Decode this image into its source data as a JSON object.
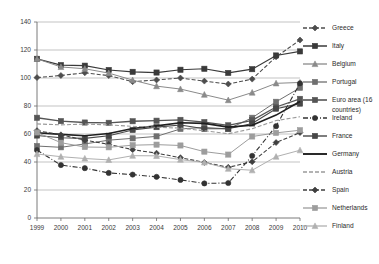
{
  "chart_data": {
    "type": "line",
    "title": "",
    "xlabel": "",
    "ylabel": "",
    "x": [
      1999,
      2000,
      2001,
      2002,
      2003,
      2004,
      2005,
      2006,
      2007,
      2008,
      2009,
      2010
    ],
    "xtick_labels": [
      "1999",
      "2000",
      "2001",
      "2002",
      "2003",
      "2004",
      "2005",
      "2006",
      "2007",
      "2008",
      "2009",
      "2010"
    ],
    "ytick_labels": [
      "0",
      "20",
      "40",
      "60",
      "80",
      "100",
      "120",
      "140"
    ],
    "yticks": [
      0,
      20,
      40,
      60,
      80,
      100,
      120,
      140
    ],
    "ylim": [
      0,
      140
    ],
    "grid": "horizontal",
    "legend_position": "right",
    "series": [
      {
        "name": "Greece",
        "marker": "diamond",
        "color": "#4d4d4d",
        "dash": "4,2",
        "width": 1.1,
        "values": [
          100.3,
          101.8,
          103.7,
          101.7,
          97.4,
          98.6,
          100.0,
          97.8,
          95.7,
          99.2,
          115.1,
          127.1
        ]
      },
      {
        "name": "Italy",
        "marker": "square",
        "color": "#3a3a3a",
        "dash": "",
        "width": 1.2,
        "values": [
          113.7,
          109.2,
          108.8,
          105.7,
          104.4,
          103.9,
          105.9,
          106.6,
          103.6,
          106.3,
          116.1,
          119.0
        ]
      },
      {
        "name": "Belgium",
        "marker": "triangle",
        "color": "#8a8a8a",
        "dash": "",
        "width": 1.0,
        "values": [
          113.7,
          107.9,
          106.6,
          103.5,
          98.5,
          94.2,
          92.1,
          88.1,
          84.2,
          89.6,
          96.2,
          96.8
        ]
      },
      {
        "name": "Portugal",
        "marker": "square",
        "color": "#6f6f6f",
        "dash": "",
        "width": 1.0,
        "values": [
          51.4,
          50.5,
          52.9,
          55.6,
          56.9,
          58.3,
          63.6,
          64.7,
          63.6,
          71.6,
          83.0,
          93.0
        ]
      },
      {
        "name": "Euro area (16 countries)",
        "marker": "square",
        "color": "#555555",
        "dash": "",
        "width": 1.3,
        "values": [
          71.6,
          69.2,
          68.2,
          68.0,
          69.1,
          69.5,
          70.1,
          68.5,
          66.2,
          69.8,
          79.3,
          85.1
        ]
      },
      {
        "name": "Ireland",
        "marker": "circle",
        "color": "#333333",
        "dash": "5,2,1,2",
        "width": 1.1,
        "values": [
          48.5,
          37.8,
          35.6,
          32.2,
          31.0,
          29.4,
          27.2,
          24.7,
          25.0,
          44.4,
          65.6,
          96.2
        ]
      },
      {
        "name": "France",
        "marker": "square",
        "color": "#474747",
        "dash": "",
        "width": 1.1,
        "values": [
          58.9,
          57.3,
          56.9,
          58.8,
          62.9,
          64.9,
          66.4,
          63.7,
          63.8,
          67.5,
          78.1,
          81.7
        ]
      },
      {
        "name": "Germany",
        "marker": "none",
        "color": "#1f1f1f",
        "dash": "",
        "width": 1.6,
        "values": [
          60.9,
          59.7,
          58.8,
          60.4,
          63.9,
          65.8,
          68.0,
          67.6,
          64.9,
          66.3,
          73.5,
          83.2
        ]
      },
      {
        "name": "Austria",
        "marker": "none",
        "color": "#9a9a9a",
        "dash": "4,2",
        "width": 1.1,
        "values": [
          67.2,
          66.5,
          67.1,
          66.5,
          65.5,
          64.8,
          64.2,
          62.3,
          60.2,
          63.8,
          69.6,
          72.3
        ]
      },
      {
        "name": "Spain",
        "marker": "diamond",
        "color": "#3f3f3f",
        "dash": "4,2",
        "width": 1.1,
        "values": [
          62.4,
          59.4,
          55.6,
          52.6,
          48.8,
          46.3,
          43.1,
          39.7,
          36.2,
          40.2,
          53.9,
          61.0
        ]
      },
      {
        "name": "Netherlands",
        "marker": "square",
        "color": "#9d9d9d",
        "dash": "",
        "width": 1.0,
        "values": [
          61.1,
          53.8,
          50.7,
          50.5,
          52.0,
          52.4,
          51.8,
          47.4,
          45.3,
          58.2,
          60.8,
          62.7
        ]
      },
      {
        "name": "Finland",
        "marker": "triangle",
        "color": "#b0b0b0",
        "dash": "",
        "width": 1.0,
        "values": [
          45.7,
          43.8,
          42.5,
          41.5,
          44.5,
          44.4,
          41.7,
          39.7,
          35.2,
          34.1,
          43.8,
          48.4
        ]
      }
    ]
  },
  "legend": {
    "items": [
      {
        "label": "Greece"
      },
      {
        "label": "Italy"
      },
      {
        "label": "Belgium"
      },
      {
        "label": "Portugal"
      },
      {
        "label": "Euro area (16"
      },
      {
        "label": "countries)"
      },
      {
        "label": "Ireland"
      },
      {
        "label": "France"
      },
      {
        "label": "Germany"
      },
      {
        "label": "Austria"
      },
      {
        "label": "Spain"
      },
      {
        "label": "Netherlands"
      },
      {
        "label": "Finland"
      }
    ]
  }
}
